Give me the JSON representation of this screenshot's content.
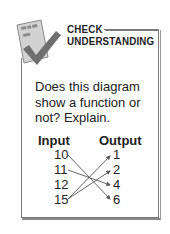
{
  "header": {
    "title_line1": "CHECK",
    "title_line2": "UNDERSTANDING"
  },
  "icon": {
    "name": "checkmark-clipboard-icon",
    "paper_color": "#cfcfcf",
    "check_color": "#6e6e6e"
  },
  "question": "Does this diagram show a function or not? Explain.",
  "diagram": {
    "input_label": "Input",
    "output_label": "Output",
    "inputs": [
      "10",
      "11",
      "12",
      "15"
    ],
    "outputs": [
      "1",
      "2",
      "4",
      "6"
    ],
    "mappings": [
      {
        "from": "10",
        "to": "6"
      },
      {
        "from": "11",
        "to": "4"
      },
      {
        "from": "15",
        "to": "1"
      },
      {
        "from": "15",
        "to": "2"
      }
    ]
  }
}
